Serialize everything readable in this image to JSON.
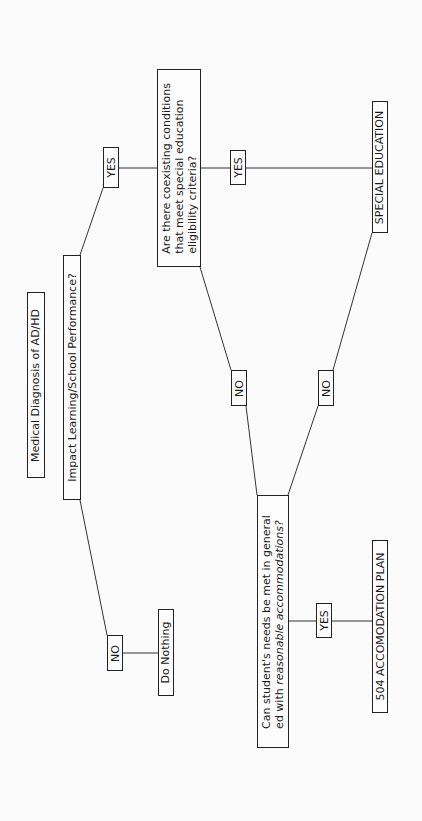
{
  "diagram": {
    "title": "Medical Diagnosis of AD/HD",
    "nodes": {
      "root": "Medical Diagnosis of AD/HD",
      "impact": "Impact Learning/School Performance?",
      "yes_impact": "YES",
      "no_impact": "NO",
      "do_nothing": "Do Nothing",
      "coexisting": "Are there coexisting conditions\nthat meet special education\neligibility criteria?",
      "yes_coexisting": "YES",
      "no_coexisting": "NO",
      "special_ed": "SPECIAL EDUCATION",
      "can_needs_line1": "Can student's needs be met in general",
      "can_needs_line2_prefix": "ed with ",
      "can_needs_line2_italic": "reasonable accommodations?",
      "no_can_needs": "NO",
      "yes_can_needs": "YES",
      "plan_504": "504 ACCOMODATION PLAN"
    },
    "colors": {
      "line": "#333333",
      "border": "#222222",
      "text": "#1a1a1a",
      "background": "#fbfbfb"
    }
  }
}
